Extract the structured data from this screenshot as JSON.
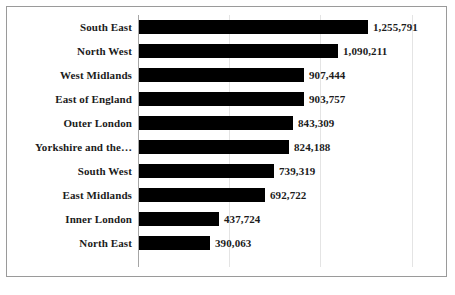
{
  "chart_data": {
    "type": "bar",
    "orientation": "horizontal",
    "title": "",
    "subtitle": "",
    "xlabel": "",
    "ylabel": "",
    "categories": [
      "South East",
      "North West",
      "West Midlands",
      "East of England",
      "Outer London",
      "Yorkshire and the…",
      "South West",
      "East Midlands",
      "Inner London",
      "North East"
    ],
    "values": [
      1255791,
      1090211,
      907444,
      903757,
      843309,
      824188,
      739319,
      692722,
      437724,
      390063
    ],
    "value_labels": [
      "1,255,791",
      "1,090,211",
      "907,444",
      "903,757",
      "843,309",
      "824,188",
      "739,319",
      "692,722",
      "437,724",
      "390,063"
    ],
    "xlim": [
      0,
      1500000
    ],
    "gridlines": [
      500000,
      1000000,
      1500000
    ],
    "grid": true,
    "legend": "none",
    "tick_labels_x": [],
    "tick_labels_y": [
      "South East",
      "North West",
      "West Midlands",
      "East of England",
      "Outer London",
      "Yorkshire and the…",
      "South West",
      "East Midlands",
      "Inner London",
      "North East"
    ],
    "colors": {
      "bar": "#000000",
      "gridline": "#e4e4e4",
      "axis": "#a6a6a6",
      "border": "#9a9a9a",
      "background": "#ffffff",
      "text": "#1b1b1b"
    }
  }
}
